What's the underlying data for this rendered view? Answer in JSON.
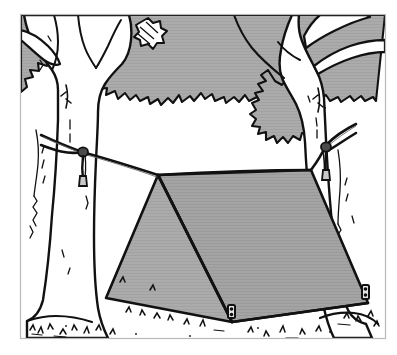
{
  "illustration": {
    "title": "A-frame tarp shelter strung between two trees",
    "style": "black and white line drawing with gray tone fills",
    "canvas": {
      "width": 397,
      "height": 355
    },
    "colors": {
      "paper": "#ffffff",
      "ink": "#111111",
      "foliage_gray": "#a9a9a9",
      "tarp_gray": "#a9a9a9",
      "tarp_gray_shadow": "#9d9d9d",
      "frame_line": "#b9b9b9"
    },
    "frame": {
      "name": "picture-frame",
      "x": 20,
      "y": 14,
      "width": 366,
      "height": 325,
      "stroke_width": 1
    },
    "elements": [
      {
        "name": "sky-background",
        "label": "Sky",
        "fill": "#ffffff"
      },
      {
        "name": "canopy-foliage",
        "label": "Tree canopy foliage",
        "fill": "#a9a9a9"
      },
      {
        "name": "left-tree",
        "label": "Left tree with forked branches",
        "fill": "#ffffff"
      },
      {
        "name": "right-tree",
        "label": "Right tree leaning right",
        "fill": "#ffffff"
      },
      {
        "name": "ridge-rope",
        "label": "Ridge rope spanning the two trunks",
        "fill": "none"
      },
      {
        "name": "left-rope-knot",
        "label": "Rope knot tied on left trunk",
        "fill": "none"
      },
      {
        "name": "right-rope-knot",
        "label": "Rope knot tied on right trunk",
        "fill": "none"
      },
      {
        "name": "tarp-end-panel",
        "label": "Tarp near-end triangular panel",
        "fill": "#a9a9a9"
      },
      {
        "name": "tarp-side-panel",
        "label": "Tarp main sloping side panel",
        "fill": "#a9a9a9"
      },
      {
        "name": "front-tent-stake",
        "label": "Front corner tent stake",
        "fill": "none"
      },
      {
        "name": "right-tent-stake",
        "label": "Right corner tent stake",
        "fill": "none"
      },
      {
        "name": "ground-grass",
        "label": "Ground line with grass tufts",
        "fill": "none"
      }
    ],
    "counts": {
      "trees": 2,
      "rope_knots": 2,
      "tent_stakes": 2,
      "tarp_panels": 2
    }
  }
}
